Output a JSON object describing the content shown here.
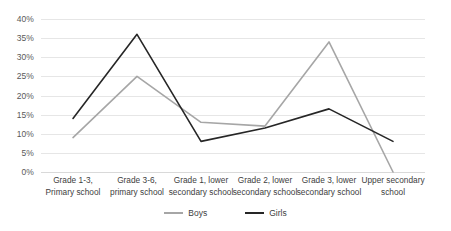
{
  "chart_data": {
    "type": "line",
    "title": "",
    "xlabel": "",
    "ylabel": "",
    "categories": [
      "Grade 1-3, Primary school",
      "Grade 3-6, primary school",
      "Grade 1, lower secondary school",
      "Grade 2, lower secondary school",
      "Grade 3, lower secondary school",
      "Upper secondary school"
    ],
    "category_lines": [
      [
        "Grade 1-3,",
        "Primary school"
      ],
      [
        "Grade 3-6,",
        "primary school"
      ],
      [
        "Grade 1, lower",
        "secondary school"
      ],
      [
        "Grade 2, lower",
        "secondary school"
      ],
      [
        "Grade 3, lower",
        "secondary school"
      ],
      [
        "Upper secondary",
        "school"
      ]
    ],
    "series": [
      {
        "name": "Boys",
        "color": "#a6a6a6",
        "values": [
          9,
          25,
          13,
          12,
          34,
          0
        ]
      },
      {
        "name": "Girls",
        "color": "#262626",
        "values": [
          14,
          36,
          8,
          11.5,
          16.5,
          8
        ]
      }
    ],
    "ylim": [
      0,
      40
    ],
    "yticks": [
      0,
      5,
      10,
      15,
      20,
      25,
      30,
      35,
      40
    ],
    "ytick_labels": [
      "0%",
      "5%",
      "10%",
      "15%",
      "20%",
      "25%",
      "30%",
      "35%",
      "40%"
    ],
    "grid": true,
    "legend_position": "bottom",
    "legend": [
      "Boys",
      "Girls"
    ]
  },
  "colors": {
    "boys": "#a6a6a6",
    "girls": "#262626",
    "gridline": "#e6e6e6",
    "tick_text": "#595959",
    "label_text": "#404040",
    "background": "#ffffff"
  }
}
